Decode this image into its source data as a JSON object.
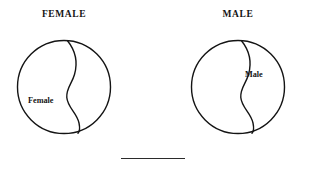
{
  "figure": {
    "background_color": "#ffffff",
    "ink_color": "#141414",
    "panels": [
      {
        "id": "female-panel",
        "title": "FEMALE",
        "shape": "circle",
        "divider": "s-curve",
        "labeled_region": "left",
        "region_label": "Female"
      },
      {
        "id": "male-panel",
        "title": "MALE",
        "shape": "circle",
        "divider": "s-curve",
        "labeled_region": "right",
        "region_label": "Male"
      }
    ],
    "rule": {
      "name": "horizontal-rule",
      "visible": true
    }
  }
}
